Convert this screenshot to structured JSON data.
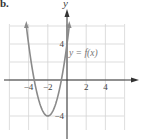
{
  "panel_label": "b.",
  "chart_data": {
    "type": "line",
    "title": "",
    "xlabel": "",
    "ylabel": "y",
    "function_label": "y = f(x)",
    "xlim": [
      -6,
      6
    ],
    "ylim": [
      -6,
      6
    ],
    "grid": true,
    "x_ticks": [
      {
        "value": -4,
        "label": "−4"
      },
      {
        "value": -2,
        "label": "−2"
      },
      {
        "value": 2,
        "label": "2"
      },
      {
        "value": 4,
        "label": "4"
      }
    ],
    "y_ticks": [
      {
        "value": 4,
        "label": "4"
      },
      {
        "value": -4,
        "label": "−4"
      }
    ],
    "series": [
      {
        "name": "y = f(x)",
        "shape": "parabola opening upward",
        "vertex": [
          -2,
          -4
        ],
        "x_intercepts_approx": [
          -3.4,
          -0.6
        ],
        "x": [
          -4.24,
          -4,
          -3.5,
          -3,
          -2.5,
          -2,
          -1.5,
          -1,
          -0.5,
          0,
          0.24
        ],
        "y": [
          6,
          4,
          0.5,
          -2,
          -3.5,
          -4,
          -3.5,
          -2,
          0.5,
          4,
          6
        ],
        "color": "#8a8a8a",
        "arrows_at_ends": true
      }
    ],
    "colors": {
      "grid": "#d4d4d4",
      "axis": "#333333",
      "curve": "#8a8a8a",
      "text": "#444444"
    }
  }
}
